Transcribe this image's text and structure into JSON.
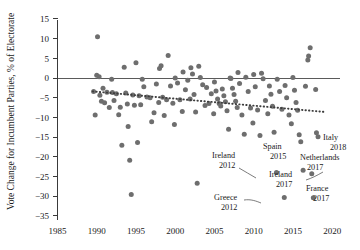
{
  "chart_data": {
    "type": "scatter",
    "title": "",
    "xlabel": "",
    "ylabel": "Vote Change for Incumbent Parties, % of Electorate",
    "xlim": [
      1985,
      2021
    ],
    "ylim": [
      -35,
      15
    ],
    "xticks": [
      1985,
      1990,
      1995,
      2000,
      2005,
      2010,
      2015,
      2020
    ],
    "yticks": [
      15,
      10,
      5,
      0,
      -5,
      -10,
      -15,
      -20,
      -25,
      -30,
      -35
    ],
    "xtick_labels": [
      "1985",
      "1990",
      "1995",
      "2000",
      "2005",
      "2010",
      "2015",
      "2020"
    ],
    "ytick_labels": [
      "15",
      "10",
      "5",
      "0",
      "−5",
      "−10",
      "−15",
      "−20",
      "−25",
      "−30",
      "−35"
    ],
    "grid": false,
    "legend": "none",
    "zero_line": 0,
    "marker_color": "#6e6e6e",
    "trend": {
      "type": "line",
      "style": "dotted",
      "color": "#3d3d3d",
      "x": [
        1989.5,
        2019.0
      ],
      "y": [
        -3.4,
        -8.6
      ]
    },
    "points": [
      [
        1989.6,
        -3.4
      ],
      [
        1989.8,
        -9.4
      ],
      [
        1990.0,
        0.7
      ],
      [
        1990.1,
        10.5
      ],
      [
        1990.3,
        0.3
      ],
      [
        1990.4,
        -4.4
      ],
      [
        1990.6,
        -5.9
      ],
      [
        1990.8,
        -2.6
      ],
      [
        1991.0,
        -6.3
      ],
      [
        1991.3,
        -3.6
      ],
      [
        1991.6,
        -7.5
      ],
      [
        1991.9,
        -0.3
      ],
      [
        1992.0,
        -3.7
      ],
      [
        1992.2,
        -5.7
      ],
      [
        1992.5,
        -4.0
      ],
      [
        1992.8,
        -9.3
      ],
      [
        1993.0,
        -7.4
      ],
      [
        1993.2,
        -17.1
      ],
      [
        1993.5,
        2.7
      ],
      [
        1993.7,
        -3.8
      ],
      [
        1993.9,
        -6.6
      ],
      [
        1994.0,
        -12.3
      ],
      [
        1994.2,
        -20.9
      ],
      [
        1994.4,
        -29.6
      ],
      [
        1994.6,
        -4.3
      ],
      [
        1994.8,
        -6.9
      ],
      [
        1995.0,
        3.9
      ],
      [
        1995.2,
        -16.4
      ],
      [
        1995.4,
        -4.5
      ],
      [
        1995.6,
        -6.8
      ],
      [
        1995.8,
        -0.3
      ],
      [
        1996.0,
        -2.2
      ],
      [
        1996.4,
        -4.8
      ],
      [
        1996.8,
        -5.0
      ],
      [
        1997.0,
        -11.1
      ],
      [
        1997.3,
        -8.8
      ],
      [
        1997.6,
        -1.5
      ],
      [
        1997.9,
        -6.2
      ],
      [
        1998.0,
        2.4
      ],
      [
        1998.2,
        3.1
      ],
      [
        1998.4,
        -4.9
      ],
      [
        1998.6,
        -9.5
      ],
      [
        1998.9,
        -5.5
      ],
      [
        1999.1,
        5.7
      ],
      [
        1999.4,
        -2.0
      ],
      [
        1999.7,
        -6.4
      ],
      [
        1999.9,
        -11.8
      ],
      [
        2000.0,
        0.0
      ],
      [
        2000.3,
        -1.3
      ],
      [
        2000.6,
        -5.5
      ],
      [
        2000.9,
        -8.5
      ],
      [
        2001.0,
        1.5
      ],
      [
        2001.3,
        -3.0
      ],
      [
        2001.6,
        -0.6
      ],
      [
        2001.9,
        -5.3
      ],
      [
        2002.0,
        2.6
      ],
      [
        2002.2,
        1.0
      ],
      [
        2002.4,
        -4.2
      ],
      [
        2002.6,
        -8.6
      ],
      [
        2002.8,
        -26.7
      ],
      [
        2003.0,
        3.0
      ],
      [
        2003.2,
        0.1
      ],
      [
        2003.5,
        -1.7
      ],
      [
        2003.8,
        -7.0
      ],
      [
        2004.0,
        -2.4
      ],
      [
        2004.3,
        -6.5
      ],
      [
        2004.6,
        -4.0
      ],
      [
        2004.9,
        -9.1
      ],
      [
        2005.0,
        -1.0
      ],
      [
        2005.2,
        -3.3
      ],
      [
        2005.4,
        -5.3
      ],
      [
        2005.6,
        -6.5
      ],
      [
        2005.8,
        -7.1
      ],
      [
        2006.0,
        -2.8
      ],
      [
        2006.2,
        -4.5
      ],
      [
        2006.4,
        -6.0
      ],
      [
        2006.6,
        -8.3
      ],
      [
        2006.8,
        -13.0
      ],
      [
        2007.0,
        0.0
      ],
      [
        2007.1,
        -0.1
      ],
      [
        2007.3,
        -2.6
      ],
      [
        2007.5,
        -4.2
      ],
      [
        2007.7,
        -5.9
      ],
      [
        2007.9,
        -7.5
      ],
      [
        2008.0,
        1.4
      ],
      [
        2008.2,
        -1.4
      ],
      [
        2008.5,
        -9.4
      ],
      [
        2008.8,
        -14.3
      ],
      [
        2009.0,
        0.2
      ],
      [
        2009.3,
        -3.4
      ],
      [
        2009.6,
        -7.6
      ],
      [
        2009.9,
        -11.4
      ],
      [
        2010.0,
        0.9
      ],
      [
        2010.2,
        -2.2
      ],
      [
        2010.5,
        -8.1
      ],
      [
        2010.8,
        -14.6
      ],
      [
        2011.0,
        1.2
      ],
      [
        2011.2,
        -0.2
      ],
      [
        2011.5,
        -5.7
      ],
      [
        2011.8,
        -9.1
      ],
      [
        2012.0,
        -2.0
      ],
      [
        2012.2,
        -4.1
      ],
      [
        2012.4,
        -7.2
      ],
      [
        2012.6,
        -13.8
      ],
      [
        2012.9,
        -24.0
      ],
      [
        2013.0,
        -0.3
      ],
      [
        2013.3,
        -3.4
      ],
      [
        2013.6,
        -7.9
      ],
      [
        2013.9,
        -30.3
      ],
      [
        2014.0,
        -1.9
      ],
      [
        2014.2,
        -5.0
      ],
      [
        2014.5,
        -9.4
      ],
      [
        2014.8,
        -11.6
      ],
      [
        2015.0,
        0.1
      ],
      [
        2015.2,
        -3.1
      ],
      [
        2015.4,
        -6.2
      ],
      [
        2015.6,
        -8.2
      ],
      [
        2015.8,
        -14.4
      ],
      [
        2016.0,
        -16.2
      ],
      [
        2016.3,
        -23.4
      ],
      [
        2016.6,
        -2.1
      ],
      [
        2016.9,
        4.6
      ],
      [
        2017.0,
        5.6
      ],
      [
        2017.2,
        7.7
      ],
      [
        2017.4,
        -24.3
      ],
      [
        2017.6,
        -30.4
      ],
      [
        2017.9,
        -2.9
      ],
      [
        2018.0,
        -13.9
      ],
      [
        2018.2,
        -14.9
      ]
    ],
    "annotations": [
      {
        "name": "italy-2018",
        "lines": [
          "Italy",
          "2018"
        ],
        "text_x": 323,
        "text_y": 140,
        "align": "start",
        "leader": null
      },
      {
        "name": "netherlands-2017",
        "lines": [
          "Netherlands",
          "2017"
        ],
        "text_x": 300,
        "text_y": 160,
        "align": "start",
        "leader": "M 323 172 C 316 176, 312 178, 306 180"
      },
      {
        "name": "spain-2015",
        "lines": [
          "Spain",
          "2015"
        ],
        "text_x": 263,
        "text_y": 149,
        "align": "start",
        "leader": null
      },
      {
        "name": "ireland-2012",
        "lines": [
          "Ireland",
          "2012"
        ],
        "text_x": 212,
        "text_y": 158,
        "align": "start",
        "leader": "M 239 168 C 245 171, 250 175, 256 178"
      },
      {
        "name": "ireland-2017",
        "lines": [
          "Ireland",
          "2017"
        ],
        "text_x": 269,
        "text_y": 177,
        "align": "start",
        "leader": null
      },
      {
        "name": "france-2017",
        "lines": [
          "France",
          "2017"
        ],
        "text_x": 306,
        "text_y": 191,
        "align": "start",
        "leader": null
      },
      {
        "name": "greece-2012",
        "lines": [
          "Greece",
          "2012"
        ],
        "text_x": 214,
        "text_y": 200,
        "align": "start",
        "leader": "M 244 200 C 251 199, 256 201, 261 203"
      }
    ]
  }
}
